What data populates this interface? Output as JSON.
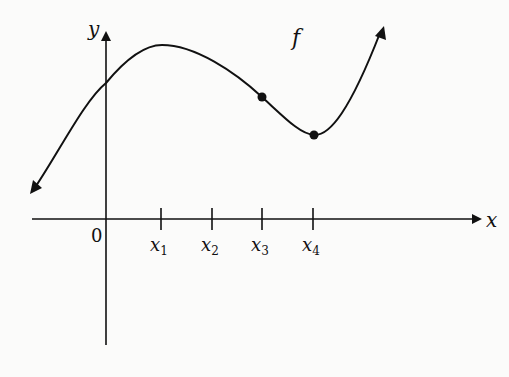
{
  "diagram": {
    "type": "function-graph",
    "function_label": "f",
    "axes": {
      "x_label": "x",
      "y_label": "y",
      "origin_label": "0"
    },
    "ticks": [
      {
        "label": "x",
        "sub": "1"
      },
      {
        "label": "x",
        "sub": "2"
      },
      {
        "label": "x",
        "sub": "3"
      },
      {
        "label": "x",
        "sub": "4"
      }
    ],
    "marked_points": [
      {
        "at": "x3",
        "description": "point on curve above x3"
      },
      {
        "at": "x4",
        "description": "local minimum above x4"
      }
    ],
    "colors": {
      "stroke": "#111111",
      "background": "#fbfbfa"
    }
  }
}
